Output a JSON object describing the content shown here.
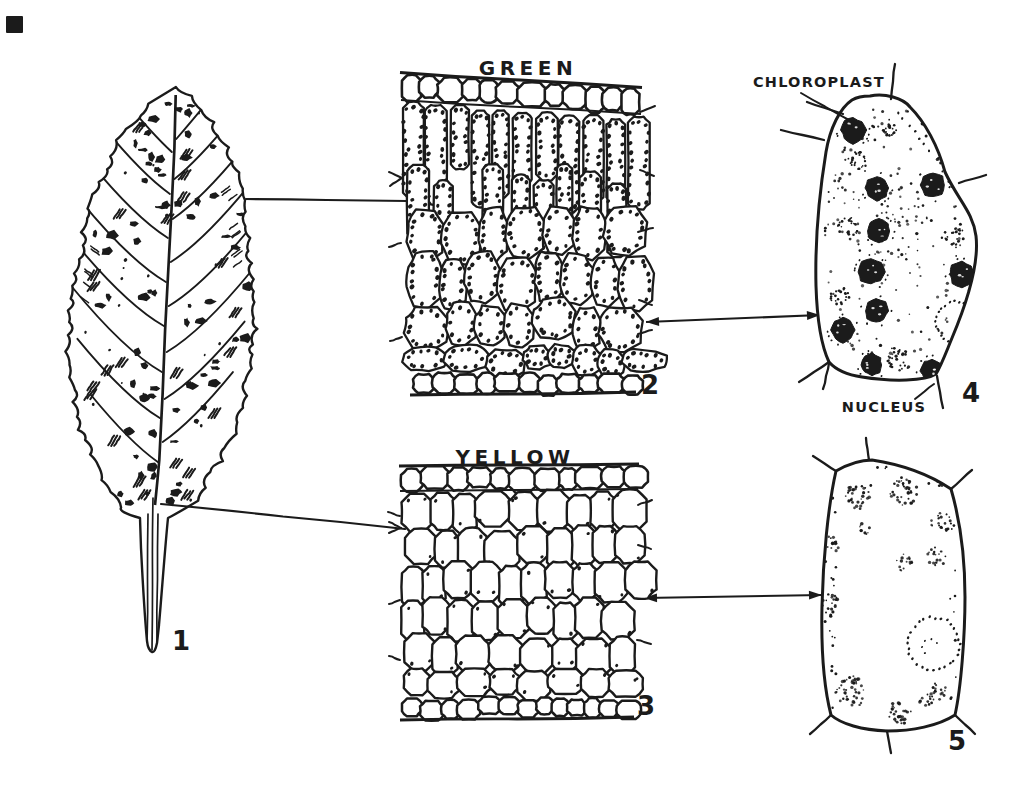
{
  "figure": {
    "leaf": {
      "number": "1"
    },
    "green_section": {
      "title": "GREEN",
      "number": "2"
    },
    "yellow_section": {
      "title": "YELLOW",
      "number": "3"
    },
    "green_cell": {
      "chloroplast_label": "CHLOROPLAST",
      "nucleus_label": "NUCLEUS",
      "number": "4"
    },
    "yellow_cell": {
      "number": "5"
    },
    "colors": {
      "ink": "#1b1b1b",
      "paper": "#ffffff"
    }
  }
}
